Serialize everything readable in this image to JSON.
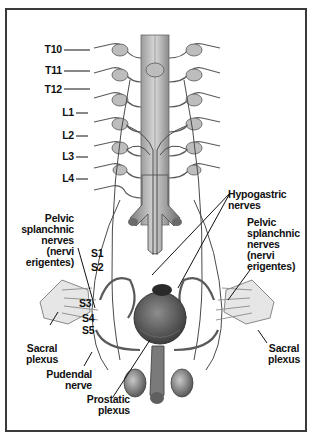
{
  "diagram": {
    "vertebral_labels": [
      "T10",
      "T11",
      "T12",
      "L1",
      "L2",
      "L3",
      "L4"
    ],
    "sacral_labels": [
      "S1",
      "S2",
      "S3",
      "S4",
      "S5"
    ],
    "labels": {
      "hypogastric_nerves": "Hypogastric nerves",
      "pelvic_splanchnic_left": "Pelvic splanchnic nerves (nervi erigentes)",
      "pelvic_splanchnic_right": "Pelvic splanchnic nerves (nervi erigentes)",
      "sacral_plexus_left": "Sacral plexus",
      "sacral_plexus_right": "Sacral plexus",
      "pudendal_nerve": "Pudendal nerve",
      "prostatic_plexus": "Prostatic plexus"
    },
    "label_lines": {
      "pelvic_splanchnic_left": [
        "Pelvic",
        "splanchnic",
        "nerves",
        "(nervi",
        "erigentes)"
      ],
      "pelvic_splanchnic_right": [
        "Pelvic",
        "splanchnic",
        "nerves",
        "(nervi",
        "erigentes)"
      ],
      "hypogastric_nerves": [
        "Hypogastric",
        "nerves"
      ],
      "sacral_plexus_left": [
        "Sacral",
        "plexus"
      ],
      "sacral_plexus_right": [
        "Sacral",
        "plexus"
      ],
      "pudendal_nerve": [
        "Pudendal",
        "nerve"
      ],
      "prostatic_plexus": [
        "Prostatic",
        "plexus"
      ]
    },
    "colors": {
      "border": "#3a3a3a",
      "nerve": "#555555",
      "tissue": "#9a9a9a",
      "text": "#111111"
    }
  }
}
